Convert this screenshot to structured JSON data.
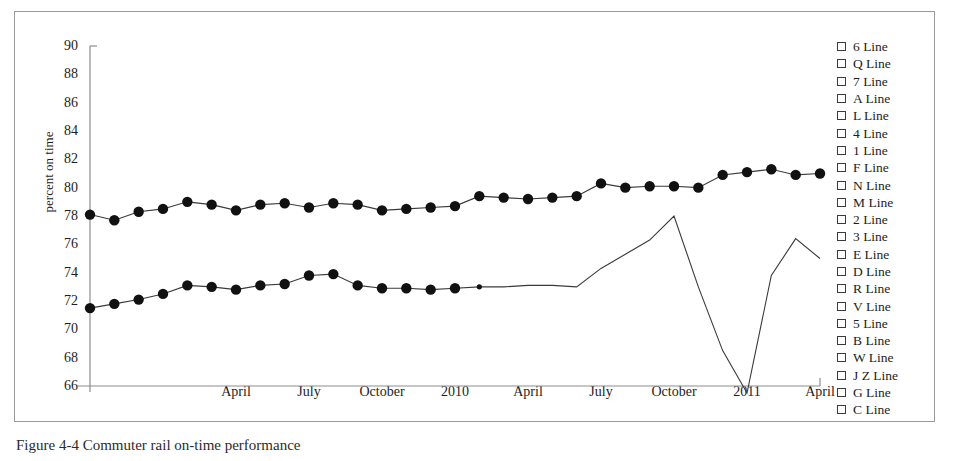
{
  "figure": {
    "caption": "Figure 4-4 Commuter rail on-time performance"
  },
  "chart_data": {
    "type": "line",
    "title": "",
    "xlabel": "",
    "ylabel": "percent on time",
    "ylim": [
      66,
      90
    ],
    "ytick_step": 2,
    "yticks": [
      90,
      88,
      86,
      84,
      82,
      80,
      78,
      76,
      74,
      72,
      70,
      68,
      66
    ],
    "xticks": [
      "April",
      "July",
      "October",
      "2010",
      "April",
      "July",
      "October",
      "2011",
      "April"
    ],
    "xtick_positions": [
      6,
      9,
      12,
      15,
      18,
      21,
      24,
      27,
      30
    ],
    "grid": false,
    "legend_position": "right",
    "series": [
      {
        "name": "upper-series",
        "marker": "filled-circle",
        "x": [
          0,
          1,
          2,
          3,
          4,
          5,
          6,
          7,
          8,
          9,
          10,
          11,
          12,
          13,
          14,
          15,
          16,
          17,
          18,
          19,
          20,
          21,
          22,
          23,
          24,
          25,
          26,
          27,
          28,
          29,
          30
        ],
        "values": [
          78.1,
          77.7,
          78.3,
          78.5,
          79.0,
          78.8,
          78.4,
          78.8,
          78.9,
          78.6,
          78.9,
          78.8,
          78.4,
          78.5,
          78.6,
          78.7,
          79.4,
          79.3,
          79.2,
          79.3,
          79.4,
          80.3,
          80.0,
          80.1,
          80.1,
          80.0,
          80.9,
          81.1,
          81.3,
          80.9,
          81.0
        ]
      },
      {
        "name": "lower-series",
        "marker": "filled-circle-partial",
        "marker_count": 17,
        "x": [
          0,
          1,
          2,
          3,
          4,
          5,
          6,
          7,
          8,
          9,
          10,
          11,
          12,
          13,
          14,
          15,
          16,
          17,
          18,
          19,
          20,
          21,
          22,
          23,
          24,
          25,
          26,
          27,
          28,
          29,
          30
        ],
        "values": [
          71.5,
          71.8,
          72.1,
          72.5,
          73.1,
          73.0,
          72.8,
          73.1,
          73.2,
          73.8,
          73.9,
          73.1,
          72.9,
          72.9,
          72.8,
          72.9,
          73.0,
          73.0,
          73.1,
          73.1,
          73.0,
          74.3,
          75.3,
          76.3,
          78.0,
          73.0,
          68.5,
          65.5,
          73.8,
          76.4,
          75.0
        ]
      }
    ]
  },
  "legend": {
    "items": [
      {
        "label": "6 Line"
      },
      {
        "label": "Q Line"
      },
      {
        "label": "7 Line"
      },
      {
        "label": "A Line"
      },
      {
        "label": "L Line"
      },
      {
        "label": "4 Line"
      },
      {
        "label": "1 Line"
      },
      {
        "label": "F Line"
      },
      {
        "label": "N Line"
      },
      {
        "label": "M Line"
      },
      {
        "label": "2 Line"
      },
      {
        "label": "3 Line"
      },
      {
        "label": "E Line"
      },
      {
        "label": "D Line"
      },
      {
        "label": "R Line"
      },
      {
        "label": "V Line"
      },
      {
        "label": "5 Line"
      },
      {
        "label": "B Line"
      },
      {
        "label": "W Line"
      },
      {
        "label": "J Z Line"
      },
      {
        "label": "G Line"
      },
      {
        "label": "C Line"
      }
    ]
  },
  "colors": {
    "line": "#3a3a3a",
    "marker": "#111111",
    "axis": "#8d8d8d",
    "frame": "#9a9a9a",
    "text": "#1d1d1d"
  }
}
